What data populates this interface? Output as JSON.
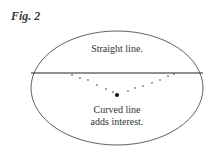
{
  "figure": {
    "label": "Fig. 2",
    "top_text": "Straight line.",
    "bottom_text_line1": "Curved line",
    "bottom_text_line2": "adds interest."
  },
  "colors": {
    "ink": "#2a2a2a",
    "background": "#ffffff"
  }
}
